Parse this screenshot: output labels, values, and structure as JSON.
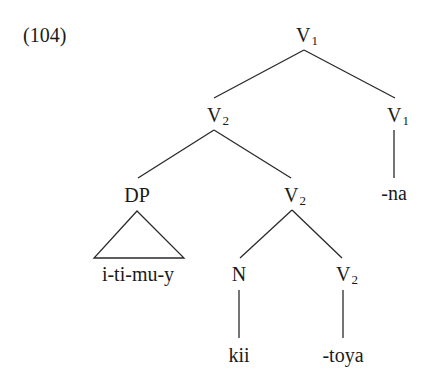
{
  "example_number": "(104)",
  "tree": {
    "root": {
      "cat": "V",
      "sub": "1"
    },
    "left_v2": {
      "cat": "V",
      "sub": "2"
    },
    "right_v1": {
      "cat": "V",
      "sub": "1"
    },
    "right_v1_terminal": "-na",
    "dp": {
      "cat": "DP"
    },
    "dp_terminal": "i-ti-mu-y",
    "inner_v2": {
      "cat": "V",
      "sub": "2"
    },
    "n": {
      "cat": "N"
    },
    "n_terminal": "kii",
    "lower_v2": {
      "cat": "V",
      "sub": "2"
    },
    "lower_v2_terminal": "-toya"
  },
  "colors": {
    "line": "#2a2a2a",
    "text": "#1a1a1a",
    "background": "#ffffff"
  }
}
